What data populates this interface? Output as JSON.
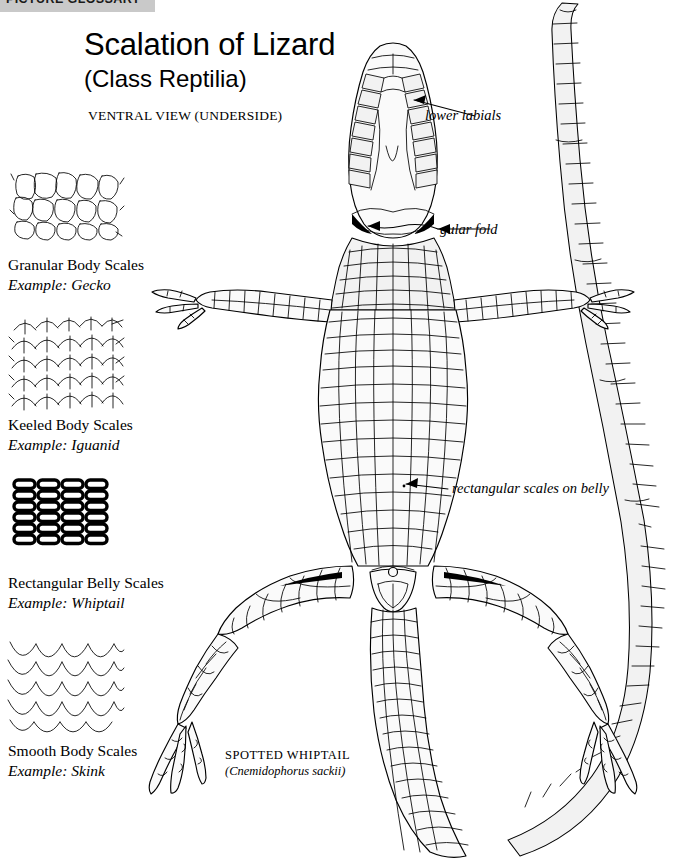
{
  "banner": {
    "label": "PICTURE GLOSSARY",
    "bg_color": "#c9c9c9"
  },
  "header": {
    "title": "Scalation of Lizard",
    "subtitle": "(Class Reptilia)",
    "view_note": "VENTRAL VIEW (UNDERSIDE)"
  },
  "legend": {
    "items": [
      {
        "icon": "granular-scales-swatch",
        "name": "Granular Body Scales",
        "example": "Example: Gecko"
      },
      {
        "icon": "keeled-scales-swatch",
        "name": "Keeled Body Scales",
        "example": "Example: Iguanid"
      },
      {
        "icon": "rectangular-scales-swatch",
        "name": "Rectangular Belly Scales",
        "example": "Example: Whiptail"
      },
      {
        "icon": "smooth-scales-swatch",
        "name": "Smooth Body Scales",
        "example": "Example: Skink"
      }
    ]
  },
  "annotations": [
    {
      "id": "lower-labials",
      "text": "lower labials"
    },
    {
      "id": "gular-fold",
      "text": "gular fold"
    },
    {
      "id": "belly-scales",
      "text": "rectangular scales on belly"
    }
  ],
  "specimen": {
    "common_name": "SPOTTED WHIPTAIL",
    "scientific_name": "(Cnemidophorus sackii)"
  },
  "colors": {
    "ink": "#000000",
    "page_background": "#ffffff",
    "scale_fill": "#f2f2f2",
    "banner_gray": "#c9c9c9"
  }
}
